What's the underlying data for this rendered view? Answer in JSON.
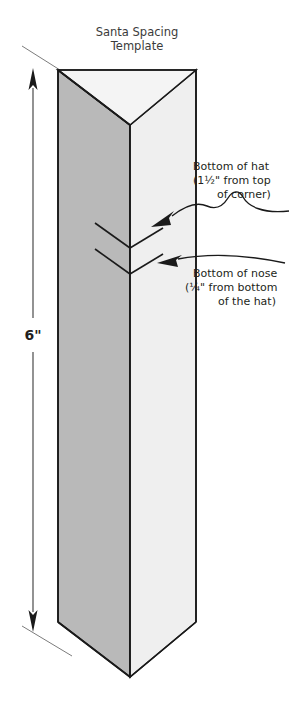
{
  "figure": {
    "title_line1": "Santa Spacing",
    "title_line2": "Template",
    "background_color": "#ffffff",
    "ink_color": "#231f20"
  },
  "dimension": {
    "label": "6\"",
    "name": "overall-height"
  },
  "callouts": [
    {
      "id": "bottom-of-hat",
      "line1": "Bottom of hat",
      "line2": "(1½\" from top",
      "line3": "of corner)"
    },
    {
      "id": "bottom-of-nose",
      "line1": "Bottom of nose",
      "line2": "(¼\" from bottom",
      "line3": "of the hat)"
    }
  ],
  "prism": {
    "left_face_color": "#b9b9b9",
    "right_face_color": "#efefef",
    "top_inner_left_color": "#d2d2d2",
    "top_inner_right_color": "#f7f7f7",
    "bottom_face_color": "#dcdcdc",
    "edge_color": "#1a1a1a"
  },
  "marks": [
    {
      "id": "hat-mark",
      "label": "hat-spacing-mark"
    },
    {
      "id": "nose-mark",
      "label": "nose-spacing-mark"
    }
  ]
}
